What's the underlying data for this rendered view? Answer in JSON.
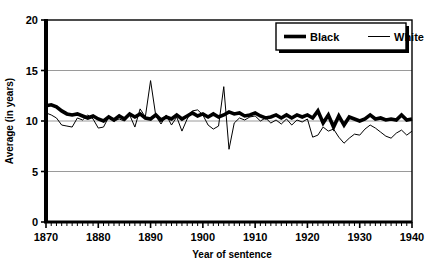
{
  "figure": {
    "clipped_top_text": "",
    "y_axis_title": "Average (in years)",
    "x_axis_title": "Year of sentence"
  },
  "legend": {
    "position": "top-right",
    "entries": [
      {
        "label": "Black",
        "style": "thick-solid-line",
        "color": "#000000",
        "width": 3.6
      },
      {
        "label": "White",
        "style": "thin-solid-line",
        "color": "#000000",
        "width": 1.0
      }
    ]
  },
  "axes": {
    "y_ticks": [
      "0",
      "5",
      "10",
      "15",
      "20"
    ],
    "x_ticks": [
      "1870",
      "1880",
      "1890",
      "1900",
      "1910",
      "1920",
      "1930",
      "1940"
    ]
  },
  "chart_data": {
    "type": "line",
    "title": "",
    "xlabel": "Year of sentence",
    "ylabel": "Average (in years)",
    "xlim": [
      1870,
      1940
    ],
    "ylim": [
      0,
      20
    ],
    "ytick_values": [
      0,
      5,
      10,
      15,
      20
    ],
    "xtick_values": [
      1870,
      1880,
      1890,
      1900,
      1910,
      1920,
      1930,
      1940
    ],
    "minor_xtick_step": 1,
    "grid": "horizontal-only",
    "legend_position": "upper right",
    "x": [
      1870,
      1871,
      1872,
      1873,
      1874,
      1875,
      1876,
      1877,
      1878,
      1879,
      1880,
      1881,
      1882,
      1883,
      1884,
      1885,
      1886,
      1887,
      1888,
      1889,
      1890,
      1891,
      1892,
      1893,
      1894,
      1895,
      1896,
      1897,
      1898,
      1899,
      1900,
      1901,
      1902,
      1903,
      1904,
      1905,
      1906,
      1907,
      1908,
      1909,
      1910,
      1911,
      1912,
      1913,
      1914,
      1915,
      1916,
      1917,
      1918,
      1919,
      1920,
      1921,
      1922,
      1923,
      1924,
      1925,
      1926,
      1927,
      1928,
      1929,
      1930,
      1931,
      1932,
      1933,
      1934,
      1935,
      1936,
      1937,
      1938,
      1939,
      1940
    ],
    "series": [
      {
        "name": "Black",
        "color": "#000000",
        "linewidth": 3.6,
        "values": [
          11.5,
          11.6,
          11.4,
          11.0,
          10.7,
          10.6,
          10.7,
          10.5,
          10.3,
          10.5,
          10.2,
          10.0,
          10.4,
          10.1,
          10.5,
          10.2,
          10.7,
          10.4,
          10.7,
          10.3,
          10.2,
          10.6,
          10.1,
          10.4,
          10.2,
          10.6,
          10.2,
          10.5,
          10.8,
          10.5,
          10.7,
          10.4,
          10.7,
          10.4,
          10.6,
          10.9,
          10.7,
          10.8,
          10.5,
          10.6,
          10.8,
          10.5,
          10.3,
          10.4,
          10.6,
          10.3,
          10.6,
          10.3,
          10.6,
          10.4,
          10.6,
          10.3,
          11.0,
          9.8,
          10.6,
          9.4,
          10.5,
          9.6,
          10.4,
          10.2,
          10.0,
          10.2,
          10.6,
          10.2,
          10.3,
          10.1,
          10.2,
          10.1,
          10.6,
          10.1,
          10.2
        ]
      },
      {
        "name": "White",
        "color": "#000000",
        "linewidth": 1.0,
        "values": [
          10.8,
          10.6,
          10.3,
          9.6,
          9.5,
          9.4,
          10.3,
          10.1,
          10.6,
          10.2,
          9.3,
          9.4,
          10.4,
          10.0,
          10.2,
          10.0,
          10.6,
          9.4,
          11.2,
          10.4,
          14.0,
          10.5,
          9.7,
          10.6,
          9.6,
          10.4,
          9.0,
          10.2,
          11.0,
          11.1,
          10.6,
          9.6,
          9.2,
          9.5,
          13.4,
          7.2,
          9.8,
          10.3,
          10.1,
          10.4,
          10.5,
          10.0,
          10.3,
          9.8,
          10.1,
          9.7,
          10.2,
          9.6,
          10.1,
          9.9,
          10.2,
          8.4,
          8.6,
          9.4,
          9.0,
          9.2,
          8.4,
          7.8,
          8.3,
          8.7,
          8.6,
          9.2,
          9.6,
          9.3,
          8.9,
          8.5,
          8.3,
          8.8,
          9.1,
          8.6,
          9.0
        ]
      }
    ]
  }
}
